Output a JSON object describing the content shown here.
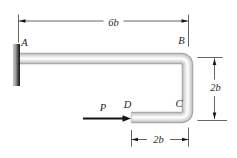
{
  "diagram": {
    "type": "mechanics-bent-bar-figure",
    "labels": {
      "point_a": "A",
      "point_b": "B",
      "point_c": "C",
      "point_d": "D"
    },
    "force": {
      "label": "P",
      "direction": "right"
    },
    "dimensions": {
      "top_span": "6b",
      "right_span": "2b",
      "bottom_span": "2b"
    },
    "colors": {
      "background": "#ffffff",
      "dim_line": "#3c3c3c",
      "arrow": "#151515",
      "text": "#1f1f1f",
      "tube_outline": "#a0a0a0",
      "tube_mid": "#d6d6d6",
      "tube_highlight": "#fbfbfb",
      "wall_light": "#c8c8c8",
      "wall_dark": "#131313"
    }
  }
}
